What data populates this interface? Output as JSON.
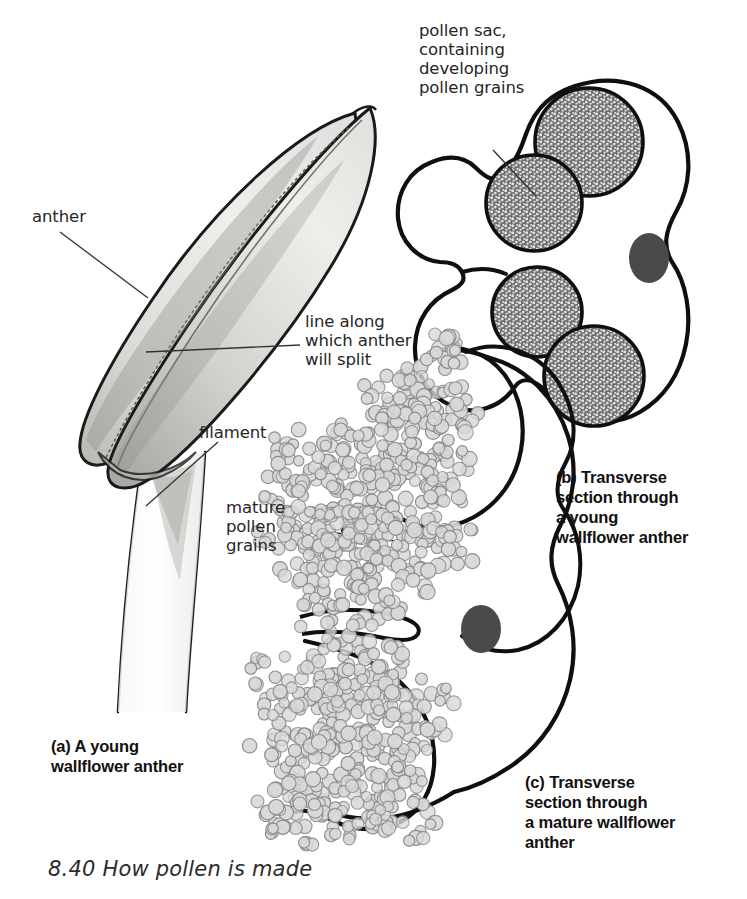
{
  "figure": {
    "number": "8.40",
    "caption": "8.40 How pollen is made",
    "title": "How pollen is made"
  },
  "labels": {
    "anther": "anther",
    "split_line": "line along\nwhich anther\nwill split",
    "filament": "filament",
    "mature_pollen": "mature\npollen\ngrains",
    "pollen_sac": "pollen sac,\ncontaining\ndeveloping\npollen grains"
  },
  "panels": [
    {
      "key": "a",
      "caption": "(a) A young\nwallflower anther",
      "description": "Whole young wallflower anther on its filament, shown in side view with two fused lobes and a dotted line marking where it will split."
    },
    {
      "key": "b",
      "caption": "(b) Transverse\nsection through\na young\nwallflower anther",
      "description": "Figure-of-eight cross section with four stippled pollen sacs and a central vascular bundle."
    },
    {
      "key": "c",
      "caption": "(c) Transverse\nsection through\na mature wallflower\nanther",
      "description": "Cross section of a split, dehisced anther with mature pollen grains spilling out of the opened lobes."
    }
  ],
  "structures": {
    "pollen_sac_count_panel_b": 4,
    "vascular_bundle_count": 1,
    "anther_lobes": 2
  },
  "colors": {
    "outline": "#111111",
    "anther_fill_light": "#f2f2ef",
    "anther_fill_mid": "#d8d8d4",
    "anther_shadow": "#9a9a96",
    "pollen_sac_fill": "#6e6e6e",
    "pollen_sac_speckle": "#e6e6e6",
    "vascular_bundle": "#4a4a4a",
    "pollen_grain_fill": "#d9d9d9",
    "pollen_grain_stroke": "#8a8a8a",
    "label_text": "#262626",
    "caption_text": "#111111",
    "background": "#ffffff"
  }
}
